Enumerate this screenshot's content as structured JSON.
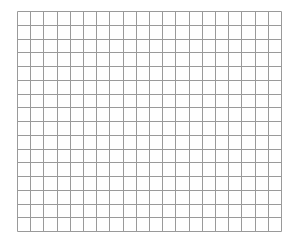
{
  "grid": {
    "origin_x": 17,
    "origin_y": 11,
    "width": 264,
    "height": 220,
    "columns": 20,
    "rows": 16,
    "line_color": "#9a9a9a",
    "background_color": "#ffffff",
    "line_width": 1
  }
}
